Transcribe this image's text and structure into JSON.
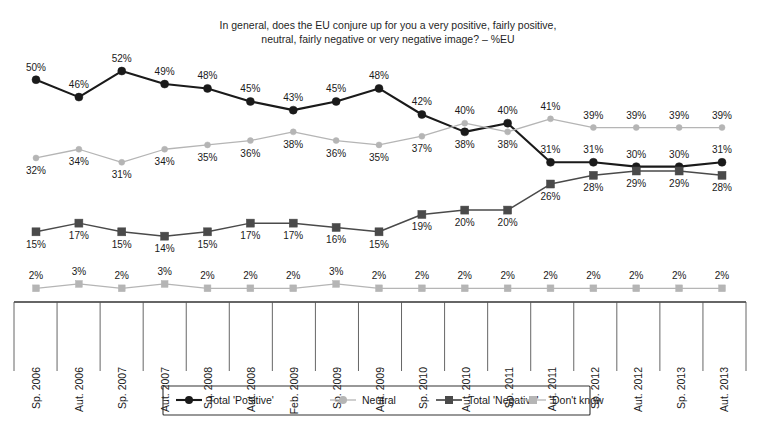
{
  "chart_data": {
    "type": "line",
    "title": "In general, does the EU conjure up for you a very positive, fairly positive, neutral, fairly negative or very negative image? – %EU",
    "title_line1": "In general, does the EU conjure up for you a very positive, fairly positive,",
    "title_line2": "neutral, fairly negative or very negative image? – %EU",
    "xlabel": "",
    "ylabel": "",
    "ylim": [
      0,
      55
    ],
    "grid": false,
    "legend_position": "bottom",
    "value_suffix": "%",
    "categories": [
      "Sp. 2006",
      "Aut. 2006",
      "Sp. 2007",
      "Aut. 2007",
      "Sp. 2008",
      "Aut. 2008",
      "Feb. 2009",
      "Sp. 2009",
      "Aut. 2009",
      "Sp. 2010",
      "Aut. 2010",
      "Sp. 2011",
      "Aut. 2011",
      "Sp. 2012",
      "Aut. 2012",
      "Sp. 2013",
      "Aut. 2013"
    ],
    "series": [
      {
        "name": "Total 'Positive'",
        "marker": "circle",
        "color": "#1a1a1a",
        "line_width": 2.1,
        "marker_size": 4.0,
        "label_offset": "above",
        "values": [
          50,
          46,
          52,
          49,
          48,
          45,
          43,
          45,
          48,
          42,
          38,
          40,
          31,
          31,
          30,
          30,
          31
        ],
        "label_positions": [
          "above",
          "above",
          "above",
          "above",
          "above",
          "above",
          "above",
          "above",
          "above",
          "above",
          "below",
          "above",
          "above",
          "above",
          "above",
          "above",
          "above"
        ]
      },
      {
        "name": "Neutral",
        "marker": "circle",
        "color": "#b5b5b5",
        "line_width": 1.3,
        "marker_size": 3.0,
        "label_offset": "below",
        "values": [
          32,
          34,
          31,
          34,
          35,
          36,
          38,
          36,
          35,
          37,
          40,
          38,
          41,
          39,
          39,
          39,
          39
        ],
        "label_positions": [
          "below",
          "below",
          "below",
          "below",
          "below",
          "below",
          "below",
          "below",
          "below",
          "below",
          "above",
          "below",
          "above",
          "above",
          "above",
          "above",
          "above"
        ]
      },
      {
        "name": "Total 'Negative'",
        "marker": "square",
        "color": "#4a4a4a",
        "line_width": 1.5,
        "marker_size": 4.0,
        "label_offset": "below",
        "values": [
          15,
          17,
          15,
          14,
          15,
          17,
          17,
          16,
          15,
          19,
          20,
          20,
          26,
          28,
          29,
          29,
          28
        ],
        "label_positions": [
          "below",
          "below",
          "below",
          "below",
          "below",
          "below",
          "below",
          "below",
          "below",
          "below",
          "below",
          "below",
          "below",
          "below",
          "below",
          "below",
          "below"
        ]
      },
      {
        "name": "Don't know",
        "marker": "square",
        "color": "#b5b5b5",
        "line_width": 1.2,
        "marker_size": 3.4,
        "label_offset": "above",
        "values": [
          2,
          3,
          2,
          3,
          2,
          2,
          2,
          3,
          2,
          2,
          2,
          2,
          2,
          2,
          2,
          2,
          2
        ],
        "label_positions": [
          "above",
          "above",
          "above",
          "above",
          "above",
          "above",
          "above",
          "above",
          "above",
          "above",
          "above",
          "above",
          "above",
          "above",
          "above",
          "above",
          "above"
        ]
      }
    ]
  },
  "legend": {
    "items": [
      {
        "label": "Total 'Positive'",
        "marker": "circle",
        "color": "#1a1a1a",
        "line_width": 2.1
      },
      {
        "label": "Neutral",
        "marker": "circle",
        "color": "#b5b5b5",
        "line_width": 1.3
      },
      {
        "label": "Total 'Negative'",
        "marker": "square",
        "color": "#4a4a4a",
        "line_width": 1.7
      },
      {
        "label": "Don't know",
        "marker": "square",
        "color": "#b5b5b5",
        "line_width": 1.3
      }
    ]
  }
}
